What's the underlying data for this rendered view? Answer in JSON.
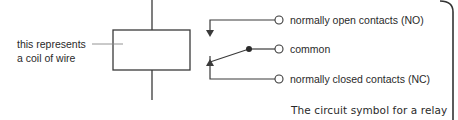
{
  "diagram": {
    "coil_label": [
      "this represents",
      "a coil of wire"
    ],
    "contacts": {
      "no_label": "normally open contacts (NO)",
      "common_label": "common",
      "nc_label": "normally closed contacts (NC)"
    },
    "caption": "The circuit symbol for a relay",
    "colors": {
      "line": "#3a3a3a",
      "text": "#2a2a2a",
      "leader_line": "#888888",
      "border": "#333333"
    }
  }
}
